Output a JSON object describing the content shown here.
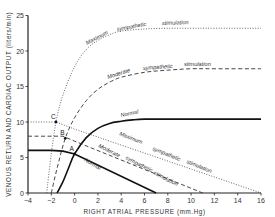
{
  "chart_data": {
    "type": "line",
    "title": "",
    "xlabel": "RIGHT ATRIAL PRESSURE (mm.Hg)",
    "ylabel": "VENOUS RETURN AND CARDIAC OUTPUT (liters/min)",
    "xlim": [
      -4,
      16
    ],
    "ylim": [
      0,
      25
    ],
    "x_ticks": [
      -4,
      -2,
      0,
      2,
      4,
      6,
      8,
      10,
      12,
      14,
      16
    ],
    "y_ticks": [
      0,
      5,
      10,
      15,
      20,
      25
    ],
    "grid": false,
    "series": [
      {
        "name": "Cardiac output - Maximum sympathetic stimulation",
        "style": "dotted",
        "x": [
          -2.4,
          -2.0,
          -1.6,
          -1.0,
          0,
          1,
          2,
          3,
          4,
          6,
          8,
          10,
          12,
          16
        ],
        "y": [
          0,
          5.5,
          10,
          13.8,
          17.8,
          20.2,
          21.5,
          22.3,
          22.8,
          23.1,
          23.2,
          23.2,
          23.2,
          23.2
        ]
      },
      {
        "name": "Cardiac output - Moderate sympathetic stimulation",
        "style": "dashed",
        "x": [
          -2.0,
          -1.5,
          -0.8,
          0,
          1,
          2,
          3,
          4,
          6,
          8,
          10,
          12,
          16
        ],
        "y": [
          0,
          3.5,
          7.7,
          10.6,
          13.0,
          14.6,
          15.6,
          16.3,
          17.0,
          17.3,
          17.5,
          17.5,
          17.5
        ]
      },
      {
        "name": "Cardiac output - Normal",
        "style": "solid",
        "x": [
          -1.5,
          -1.0,
          -0.5,
          0,
          1,
          2,
          3,
          4,
          5,
          6,
          8,
          16
        ],
        "y": [
          0,
          1.6,
          3.6,
          5.5,
          7.8,
          9.1,
          9.8,
          10.1,
          10.3,
          10.4,
          10.4,
          10.4
        ]
      },
      {
        "name": "Venous return - Maximum sympathetic stimulation",
        "style": "dotted",
        "x": [
          -4,
          -1.6,
          0,
          16
        ],
        "y": [
          10,
          10,
          9.0,
          0
        ]
      },
      {
        "name": "Venous return - Moderate sympathetic stimulation",
        "style": "dashed",
        "x": [
          -4,
          -1.0,
          0,
          11
        ],
        "y": [
          8,
          8,
          7.3,
          0
        ]
      },
      {
        "name": "Venous return - Normal",
        "style": "solid",
        "x": [
          -4,
          -2,
          -1,
          0,
          7
        ],
        "y": [
          6,
          6,
          5.9,
          5.5,
          0
        ]
      }
    ],
    "annotations": [
      {
        "label": "A",
        "x": 0,
        "y": 5.5
      },
      {
        "label": "B",
        "x": -0.8,
        "y": 7.7
      },
      {
        "label": "C",
        "x": -1.6,
        "y": 10
      }
    ],
    "curve_labels": {
      "co_max": [
        "Maximum",
        "sympathetic",
        "stimulation"
      ],
      "co_mod": [
        "Moderate",
        "sympathetic",
        "stimulation"
      ],
      "co_norm": "Normal",
      "vr_max": [
        "Maximum",
        "sympathetic",
        "stimulation"
      ],
      "vr_mod": [
        "Moderate",
        "sympathetic",
        "stimulation"
      ],
      "vr_norm": "Normal"
    }
  },
  "axis": {
    "xlabel_parts": [
      "RIGHT",
      "ATRIAL",
      "PRESSURE",
      "(mm.Hg)"
    ],
    "ylabel_parts": [
      "VENOUS",
      "RETURN",
      "AND",
      "CARDIAC",
      "OUTPUT",
      "(liters/min)"
    ]
  }
}
